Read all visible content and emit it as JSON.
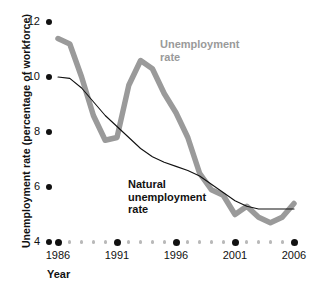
{
  "chart_data": {
    "type": "line",
    "title": "",
    "xlabel": "Year",
    "ylabel": "Unemployment rate (percentage of workforce)",
    "xlim": [
      1986,
      2006
    ],
    "ylim": [
      4,
      12
    ],
    "grid": false,
    "legend_position": "inline-annotations",
    "xticks": [
      1986,
      1991,
      1996,
      2001,
      2006
    ],
    "xtick_labels": [
      "1986",
      "1991",
      "1996",
      "2001",
      "2006"
    ],
    "yticks": [
      4,
      6,
      8,
      10,
      12
    ],
    "ytick_labels": [
      "4",
      "6",
      "8",
      "10",
      "12"
    ],
    "x": [
      1986,
      1987,
      1988,
      1989,
      1990,
      1991,
      1992,
      1993,
      1994,
      1995,
      1996,
      1997,
      1998,
      1999,
      2000,
      2001,
      2002,
      2003,
      2004,
      2005,
      2006
    ],
    "series": [
      {
        "name": "Unemployment rate",
        "color": "#9a9a9a",
        "width": 5.5,
        "values": [
          11.4,
          11.2,
          10.0,
          8.6,
          7.7,
          7.8,
          9.7,
          10.6,
          10.3,
          9.4,
          8.7,
          7.8,
          6.5,
          5.9,
          5.7,
          5.0,
          5.3,
          4.9,
          4.7,
          4.9,
          5.4
        ]
      },
      {
        "name": "Natural unemployment rate",
        "color": "#111111",
        "width": 1.1,
        "values": [
          10.0,
          9.95,
          9.6,
          9.1,
          8.6,
          8.2,
          7.8,
          7.4,
          7.1,
          6.9,
          6.75,
          6.6,
          6.4,
          6.1,
          5.8,
          5.5,
          5.3,
          5.2,
          5.2,
          5.2,
          5.2
        ]
      }
    ],
    "annotations": [
      {
        "text_line1": "Unemployment",
        "text_line2": "rate",
        "series": "Unemployment rate",
        "color": "#9a9a9a"
      },
      {
        "text_line1": "Natural",
        "text_line2": "unemployment",
        "text_line3": "rate",
        "series": "Natural unemployment rate",
        "color": "#111111"
      }
    ]
  },
  "axis": {
    "y_title": "Unemployment rate (percentage of workforce)",
    "x_title": "Year"
  },
  "annotations": {
    "unemployment": {
      "line1": "Unemployment",
      "line2": "rate"
    },
    "natural": {
      "line1": "Natural",
      "line2": "unemployment",
      "line3": "rate"
    }
  }
}
